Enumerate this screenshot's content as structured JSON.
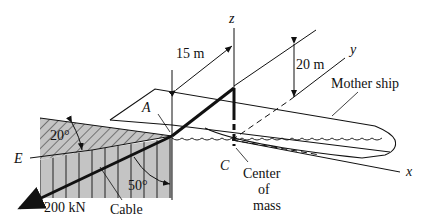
{
  "diagram": {
    "type": "engineering-statics-figure",
    "labels": {
      "z_axis": "z",
      "y_axis": "y",
      "x_axis": "x",
      "point_a": "A",
      "point_c": "C",
      "point_e": "E",
      "dim_15": "15 m",
      "dim_20": "20 m",
      "mother_ship": "Mother ship",
      "angle_20": "20°",
      "angle_50": "50°",
      "force": "200 kN",
      "cable": "Cable",
      "center_line1": "Center",
      "center_line2": "of",
      "center_line3": "mass"
    },
    "colors": {
      "line": "#111111",
      "hatch_fill": "#bdbdbd",
      "background": "#ffffff"
    }
  }
}
